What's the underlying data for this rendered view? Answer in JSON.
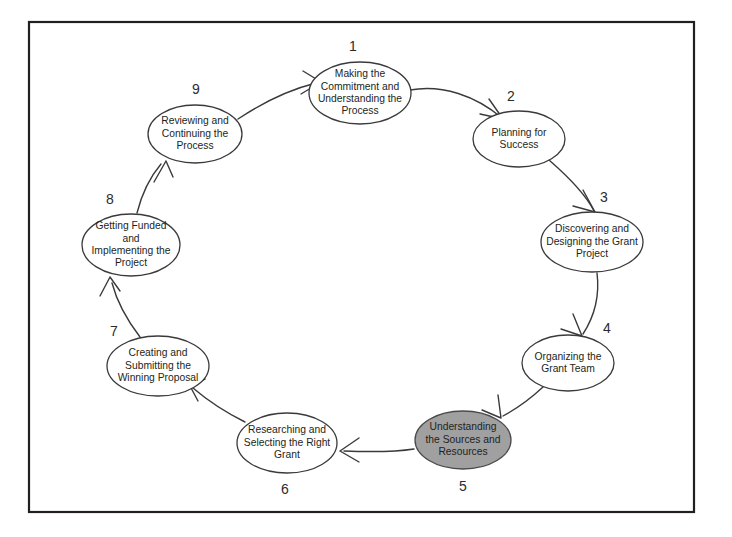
{
  "diagram": {
    "type": "cycle-flow-diagram",
    "frame": {
      "x": 29,
      "y": 22,
      "width": 665,
      "height": 490
    },
    "colors": {
      "frame_border": "#231f20",
      "node_stroke": "#3a3a3c",
      "node_fill": "#ffffff",
      "highlight_fill": "#a0a0a0",
      "text": "#231f20",
      "connector": "#3a3a3c"
    },
    "nodes": [
      {
        "number": "1",
        "lines": [
          "Making the",
          "Commitment and",
          "Understanding the",
          "Process"
        ],
        "cx": 360,
        "cy": 93,
        "rx": 51,
        "ry": 31,
        "num_x": 353,
        "num_y": 47,
        "highlighted": false
      },
      {
        "number": "2",
        "lines": [
          "Planning for",
          "Success"
        ],
        "cx": 519,
        "cy": 139,
        "rx": 46,
        "ry": 28,
        "num_x": 511,
        "num_y": 97,
        "highlighted": false
      },
      {
        "number": "3",
        "lines": [
          "Discovering and",
          "Designing the Grant",
          "Project"
        ],
        "cx": 592,
        "cy": 242,
        "rx": 51,
        "ry": 30,
        "num_x": 604,
        "num_y": 198,
        "highlighted": false
      },
      {
        "number": "4",
        "lines": [
          "Organizing the",
          "Grant Team"
        ],
        "cx": 568,
        "cy": 363,
        "rx": 46,
        "ry": 28,
        "num_x": 607,
        "num_y": 329,
        "highlighted": false
      },
      {
        "number": "5",
        "lines": [
          "Understanding",
          "the Sources and",
          "Resources"
        ],
        "cx": 463,
        "cy": 440,
        "rx": 48,
        "ry": 29,
        "num_x": 463,
        "num_y": 487,
        "highlighted": true
      },
      {
        "number": "6",
        "lines": [
          "Researching and",
          "Selecting the Right",
          "Grant"
        ],
        "cx": 287,
        "cy": 443,
        "rx": 50,
        "ry": 30,
        "num_x": 285,
        "num_y": 490,
        "highlighted": false
      },
      {
        "number": "7",
        "lines": [
          "Creating and",
          "Submitting the",
          "Winning Proposal"
        ],
        "cx": 158,
        "cy": 366,
        "rx": 51,
        "ry": 30,
        "num_x": 114,
        "num_y": 332,
        "highlighted": false
      },
      {
        "number": "8",
        "lines": [
          "Getting Funded",
          "and",
          "Implementing the",
          "Project"
        ],
        "cx": 131,
        "cy": 245,
        "rx": 49,
        "ry": 31,
        "num_x": 110,
        "num_y": 200,
        "highlighted": false
      },
      {
        "number": "9",
        "lines": [
          "Reviewing and",
          "Continuing the",
          "Process"
        ],
        "cx": 195,
        "cy": 134,
        "rx": 47,
        "ry": 29,
        "num_x": 196,
        "num_y": 90,
        "highlighted": false
      }
    ],
    "connectors": [
      {
        "from": "1",
        "to": "2",
        "path": "M 410 90 C 442 84, 476 96, 502 118",
        "arrow": "M 489 99 L 503 119 M 480 114 L 503 119"
      },
      {
        "from": "2",
        "to": "3",
        "path": "M 549 160 C 572 180, 588 199, 594 211",
        "arrow": "M 583 190 L 595 212 M 573 206 L 595 212"
      },
      {
        "from": "3",
        "to": "4",
        "path": "M 597 273 C 600 297, 594 317, 583 334",
        "arrow": "M 573 314 L 582 336 M 561 329 L 582 336"
      },
      {
        "from": "4",
        "to": "5",
        "path": "M 543 387 C 528 401, 516 409, 503 416",
        "arrow": "M 498 395 L 501 418 M 482 410 L 501 418"
      },
      {
        "from": "5",
        "to": "6",
        "path": "M 414 449 C 395 452, 370 452, 344 451",
        "arrow": "M 359 438 L 340 451 M 359 462 L 340 451"
      },
      {
        "from": "6",
        "to": "7",
        "path": "M 245 422 C 225 412, 207 400, 193 388",
        "arrow": "M 205 379 L 190 386 M 198 401 L 190 386"
      },
      {
        "from": "7",
        "to": "8",
        "path": "M 140 337 C 127 320, 117 302, 112 283",
        "arrow": "M 100 296 L 110 277 M 120 291 L 110 277"
      },
      {
        "from": "8",
        "to": "9",
        "path": "M 137 213 C 142 193, 150 177, 161 164",
        "arrow": "M 154 182 L 166 161 M 173 177 L 166 161"
      },
      {
        "from": "9",
        "to": "1",
        "path": "M 238 119 C 268 99, 296 88, 316 83",
        "arrow": "M 303 71 L 321 82 M 301 94 L 321 82"
      }
    ]
  }
}
